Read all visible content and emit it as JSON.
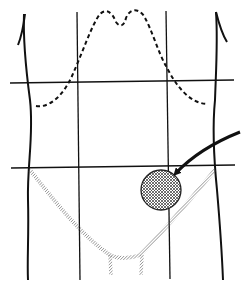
{
  "figure": {
    "type": "anatomical-diagram",
    "subject": "abdomen divided into nine regions",
    "text_labels": [],
    "colors": {
      "background": "#ffffff",
      "ink": "#1a1a1a",
      "hatch": "#555555"
    },
    "grid": {
      "vertical_lines_x": [
        77,
        166
      ],
      "horizontal_lines_y": [
        82,
        166
      ]
    },
    "highlight": {
      "shape": "circle",
      "fill": "cross-hatch",
      "center": [
        161,
        190
      ],
      "radius": 20,
      "region": "lower-right of image (left iliac region)"
    },
    "arrow": {
      "from": [
        240,
        132
      ],
      "to": [
        173,
        176
      ]
    }
  }
}
